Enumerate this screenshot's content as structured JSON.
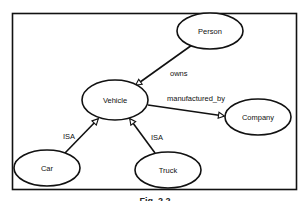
{
  "figure": {
    "caption": "Fig. 2.2",
    "colors": {
      "stroke": "#111111",
      "background": "#ffffff"
    }
  },
  "nodes": [
    {
      "id": "person",
      "label": "Person",
      "cx": 210,
      "cy": 31,
      "rx": 33,
      "ry": 18
    },
    {
      "id": "vehicle",
      "label": "Vehicle",
      "cx": 115,
      "cy": 100,
      "rx": 33,
      "ry": 20
    },
    {
      "id": "company",
      "label": "Company",
      "cx": 258,
      "cy": 117,
      "rx": 33,
      "ry": 18
    },
    {
      "id": "car",
      "label": "Car",
      "cx": 47,
      "cy": 168,
      "rx": 33,
      "ry": 18
    },
    {
      "id": "truck",
      "label": "Truck",
      "cx": 168,
      "cy": 170,
      "rx": 33,
      "ry": 18
    }
  ],
  "edges": [
    {
      "id": "owns",
      "from": "person",
      "to": "vehicle",
      "label": "owns"
    },
    {
      "id": "manufactured_by",
      "from": "vehicle",
      "to": "company",
      "label": "manufactured_by"
    },
    {
      "id": "car_isa",
      "from": "car",
      "to": "vehicle",
      "label": "ISA"
    },
    {
      "id": "truck_isa",
      "from": "truck",
      "to": "vehicle",
      "label": "ISA"
    }
  ]
}
